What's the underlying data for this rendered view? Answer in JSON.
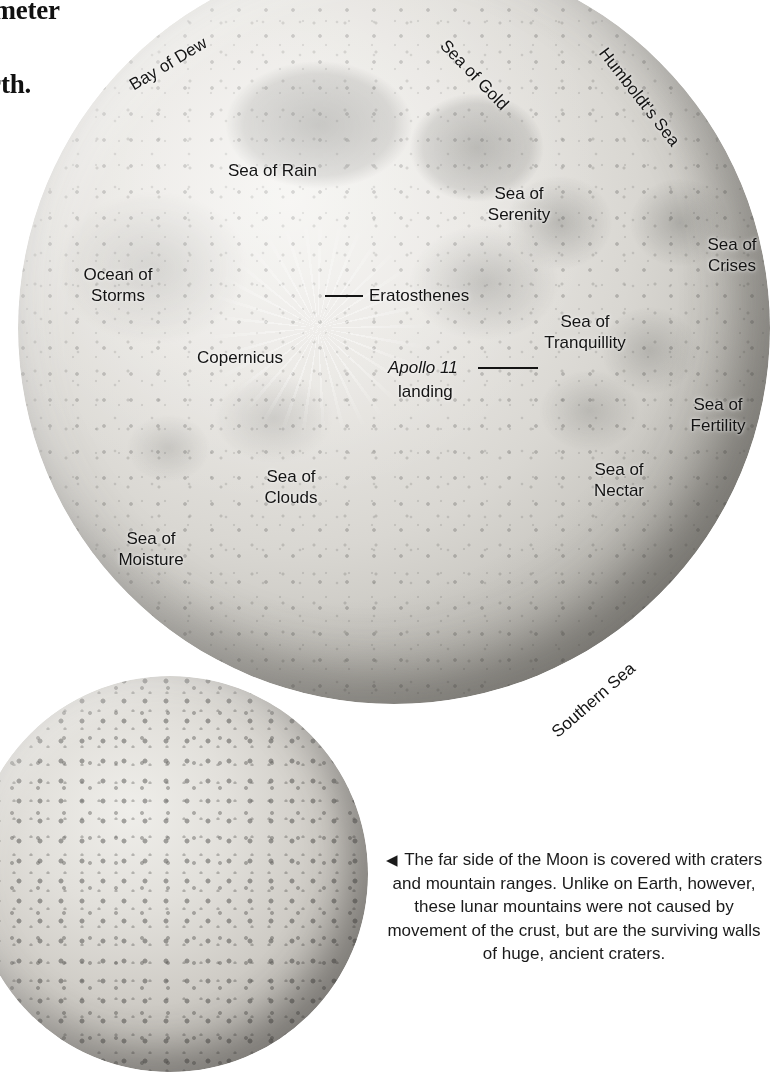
{
  "headline": {
    "lines": [
      "diameter",
      "age",
      "Earth."
    ]
  },
  "nearside_map": {
    "name": "near-side-moon",
    "labels": [
      {
        "id": "bay-of-dew",
        "text": "Bay of Dew",
        "x": 126,
        "y": 78,
        "rot": -31,
        "lines": 1
      },
      {
        "id": "sea-of-gold",
        "text": "Sea of Gold",
        "x": 450,
        "y": 36,
        "rot": 46,
        "lines": 1
      },
      {
        "id": "humboldts-sea",
        "text": "Humboldt's Sea",
        "x": 610,
        "y": 44,
        "rot": 52,
        "lines": 1
      },
      {
        "id": "sea-of-rain",
        "text": "Sea of Rain",
        "x": 228,
        "y": 161,
        "rot": 0,
        "lines": 1
      },
      {
        "id": "sea-of-serenity",
        "text": "Sea of\nSerenity",
        "x": 473,
        "y": 183,
        "rot": 0,
        "lines": 2
      },
      {
        "id": "sea-of-crises",
        "text": "Sea of\nCrises",
        "x": 686,
        "y": 234,
        "rot": 0,
        "lines": 2
      },
      {
        "id": "ocean-of-storms",
        "text": "Ocean of\nStorms",
        "x": 72,
        "y": 264,
        "rot": 0,
        "lines": 2
      },
      {
        "id": "eratosthenes",
        "text": "Eratosthenes",
        "x": 369,
        "y": 286,
        "rot": 0,
        "lines": 1
      },
      {
        "id": "sea-of-tranquillity",
        "text": "Sea of\nTranquillity",
        "x": 539,
        "y": 311,
        "rot": 0,
        "lines": 2
      },
      {
        "id": "copernicus",
        "text": "Copernicus",
        "x": 197,
        "y": 348,
        "rot": 0,
        "lines": 1
      },
      {
        "id": "apollo-11",
        "text": "Apollo 11",
        "x": 388,
        "y": 358,
        "rot": 0,
        "lines": 1,
        "italic": true
      },
      {
        "id": "apollo-11-landing",
        "text": "landing",
        "x": 398,
        "y": 382,
        "rot": 0,
        "lines": 1
      },
      {
        "id": "sea-of-fertility",
        "text": "Sea of\nFertility",
        "x": 672,
        "y": 394,
        "rot": 0,
        "lines": 2
      },
      {
        "id": "sea-of-clouds",
        "text": "Sea of\nClouds",
        "x": 245,
        "y": 466,
        "rot": 0,
        "lines": 2
      },
      {
        "id": "sea-of-nectar",
        "text": "Sea of\nNectar",
        "x": 573,
        "y": 459,
        "rot": 0,
        "lines": 2
      },
      {
        "id": "sea-of-moisture",
        "text": "Sea of\nMoisture",
        "x": 105,
        "y": 528,
        "rot": 0,
        "lines": 2
      },
      {
        "id": "southern-sea",
        "text": "Southern Sea",
        "x": 548,
        "y": 727,
        "rot": -41,
        "lines": 1
      }
    ],
    "leaders": [
      {
        "id": "eratosthenes-leader",
        "x": 325,
        "y": 295,
        "w": 38
      },
      {
        "id": "apollo-11-leader",
        "x": 478,
        "y": 367,
        "w": 60
      }
    ]
  },
  "farside_map": {
    "name": "far-side-moon"
  },
  "caption": {
    "marker": "◀",
    "text": "The far side of the Moon is covered with craters and mountain ranges. Unlike on Earth, however, these lunar mountains were not caused by movement of the crust, but are the surviving walls of huge, ancient craters."
  },
  "colors": {
    "ink": "#141414",
    "paper": "#ffffff",
    "moon_light": "#f4f3f0",
    "moon_mid": "#c3c1bb",
    "moon_dark": "#7d7b76"
  }
}
